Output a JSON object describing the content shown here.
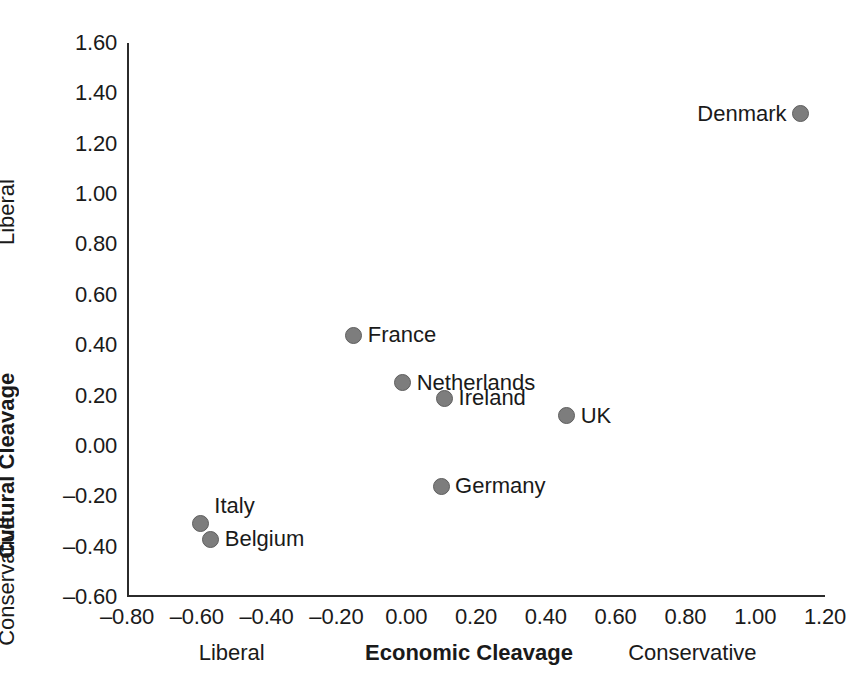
{
  "chart_data": {
    "type": "scatter",
    "title": "",
    "xlabel": "Economic Cleavage",
    "ylabel": "Cultural Cleavage",
    "xlim": [
      -0.8,
      1.2
    ],
    "ylim": [
      -0.6,
      1.6
    ],
    "grid": false,
    "legend": "none",
    "xticks": [
      "–0.80",
      "–0.60",
      "–0.40",
      "–0.20",
      "0.00",
      "0.20",
      "0.40",
      "0.60",
      "0.80",
      "1.00",
      "1.20"
    ],
    "xtick_values": [
      -0.8,
      -0.6,
      -0.4,
      -0.2,
      0.0,
      0.2,
      0.4,
      0.6,
      0.8,
      1.0,
      1.2
    ],
    "yticks": [
      "–0.60",
      "–0.40",
      "–0.20",
      "0.00",
      "0.20",
      "0.40",
      "0.60",
      "0.80",
      "1.00",
      "1.20",
      "1.40",
      "1.60"
    ],
    "ytick_values": [
      -0.6,
      -0.4,
      -0.2,
      0.0,
      0.2,
      0.4,
      0.6,
      0.8,
      1.0,
      1.2,
      1.4,
      1.6
    ],
    "x_axis_anchors": [
      {
        "text": "Liberal",
        "at": -0.5,
        "bold": false
      },
      {
        "text": "Economic Cleavage",
        "at": 0.18,
        "bold": true
      },
      {
        "text": "Conservative",
        "at": 0.82,
        "bold": false
      }
    ],
    "y_axis_anchors": [
      {
        "text": "Conservative",
        "at": -0.03,
        "bold": false
      },
      {
        "text": "Cultural Cleavage",
        "at": 0.66,
        "bold": true
      },
      {
        "text": "Liberal",
        "at": 1.19,
        "bold": false
      }
    ],
    "marker_color": "#7d7d7d",
    "marker_edge_color": "#5e5e5e",
    "axis_color": "#2b2b2b",
    "points": [
      {
        "label": "Denmark",
        "x": 1.13,
        "y": 1.32,
        "label_side": "left"
      },
      {
        "label": "France",
        "x": -0.15,
        "y": 0.44,
        "label_side": "right"
      },
      {
        "label": "Netherlands",
        "x": -0.01,
        "y": 0.25,
        "label_side": "right"
      },
      {
        "label": "Ireland",
        "x": 0.11,
        "y": 0.19,
        "label_side": "right"
      },
      {
        "label": "UK",
        "x": 0.46,
        "y": 0.12,
        "label_side": "right"
      },
      {
        "label": "Germany",
        "x": 0.1,
        "y": -0.16,
        "label_side": "right"
      },
      {
        "label": "Italy",
        "x": -0.59,
        "y": -0.31,
        "label_side": "right",
        "label_dy": -18
      },
      {
        "label": "Belgium",
        "x": -0.56,
        "y": -0.37,
        "label_side": "right"
      }
    ]
  }
}
